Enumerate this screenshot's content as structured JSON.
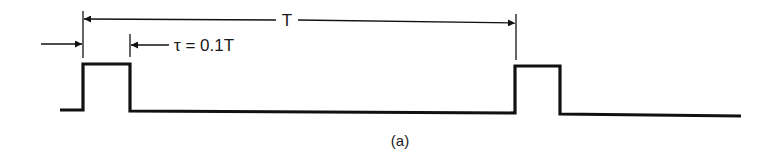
{
  "diagram": {
    "type": "pulse-train-timing",
    "caption": "(a)",
    "period_label": "T",
    "pulse_width_label": "τ = 0.1T",
    "ink_color": "#111111",
    "background": "#ffffff",
    "pulses": [
      {
        "rise_x": 83,
        "fall_x": 130
      },
      {
        "rise_x": 515,
        "fall_x": 560
      }
    ]
  }
}
